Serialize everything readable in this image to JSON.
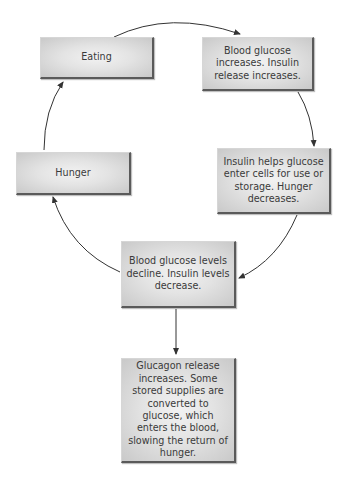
{
  "diagram": {
    "type": "cycle-flowchart",
    "nodes": [
      {
        "id": "eating",
        "label": "Eating"
      },
      {
        "id": "increase",
        "label": "Blood glucose increases. Insulin release increases."
      },
      {
        "id": "insulin",
        "label": "Insulin helps glucose enter cells for use or storage. Hunger decreases."
      },
      {
        "id": "decline",
        "label": "Blood glucose levels decline. Insulin levels decrease."
      },
      {
        "id": "hunger",
        "label": "Hunger"
      },
      {
        "id": "glucagon",
        "label": "Glucagon release increases. Some stored supplies are converted to glucose, which enters the blood, slowing the return of hunger."
      }
    ],
    "edges": [
      {
        "from": "eating",
        "to": "increase",
        "style": "curved"
      },
      {
        "from": "increase",
        "to": "insulin",
        "style": "curved"
      },
      {
        "from": "insulin",
        "to": "decline",
        "style": "curved"
      },
      {
        "from": "decline",
        "to": "hunger",
        "style": "curved"
      },
      {
        "from": "hunger",
        "to": "eating",
        "style": "curved"
      },
      {
        "from": "decline",
        "to": "glucagon",
        "style": "straight"
      }
    ],
    "colors": {
      "box_fill": "#e3e3e3",
      "box_shadow": "#5a5a5a",
      "arrow": "#333333",
      "text": "#3a3a3a"
    }
  }
}
